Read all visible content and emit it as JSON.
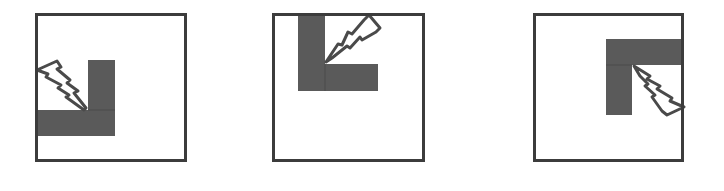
{
  "colors": {
    "background": "#ffffff",
    "frame": "#3c3c3c",
    "fill": "#5a5a5a",
    "bolt_stroke": "#4a4a4a",
    "bolt_fill": "#ffffff"
  },
  "panels": [
    {
      "id": "panel-1",
      "description": "L-shaped corner at lower-left with lightning bolt striking inner corner from upper-left",
      "frame": {
        "x": 35,
        "y": 13,
        "w": 152,
        "h": 149
      },
      "icon": "lightning-bolt-icon",
      "corner_position": "bottom-left"
    },
    {
      "id": "panel-2",
      "description": "L-shaped corner at top-left with lightning bolt striking inner corner from upper-right",
      "frame": {
        "x": 272,
        "y": 13,
        "w": 153,
        "h": 149
      },
      "icon": "lightning-bolt-icon",
      "corner_position": "top-left"
    },
    {
      "id": "panel-3",
      "description": "L-shaped corner at top-right with lightning bolt striking inner corner from lower-right",
      "frame": {
        "x": 533,
        "y": 13,
        "w": 151,
        "h": 149
      },
      "icon": "lightning-bolt-icon",
      "corner_position": "top-right"
    }
  ]
}
